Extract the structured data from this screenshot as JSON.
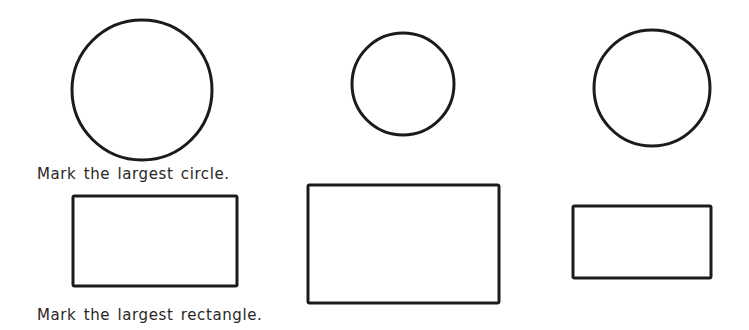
{
  "worksheet": {
    "stroke_color": "#1e1a1a",
    "background": "#ffffff",
    "instructions": {
      "circle": "Mark the largest circle.",
      "rectangle": "Mark the largest rectangle."
    },
    "circles": [
      {
        "label": "circle-1",
        "cx": 142,
        "cy": 90,
        "r": 70
      },
      {
        "label": "circle-2",
        "cx": 403,
        "cy": 84,
        "r": 51
      },
      {
        "label": "circle-3",
        "cx": 652,
        "cy": 88,
        "r": 58
      }
    ],
    "rectangles": [
      {
        "label": "rectangle-1",
        "x": 73,
        "y": 196,
        "w": 164,
        "h": 90
      },
      {
        "label": "rectangle-2",
        "x": 308,
        "y": 185,
        "w": 191,
        "h": 118
      },
      {
        "label": "rectangle-3",
        "x": 573,
        "y": 206,
        "w": 138,
        "h": 72
      }
    ]
  }
}
